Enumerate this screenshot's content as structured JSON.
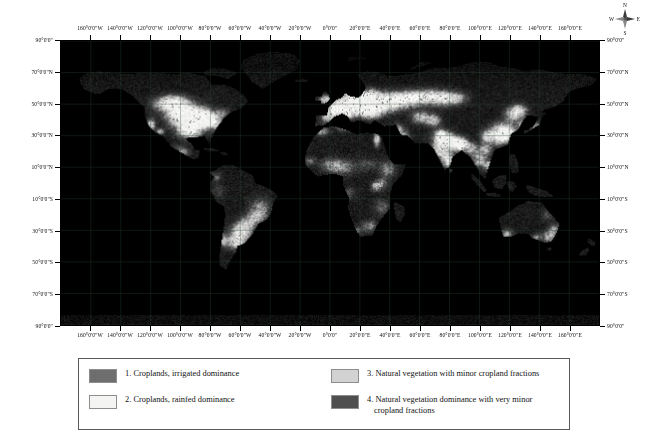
{
  "figure": {
    "type": "world-choropleth-map",
    "projection": "geographic",
    "background_color": "#ffffff"
  },
  "map": {
    "ocean_color": "#000000",
    "frame_color": "#000000",
    "graticule_color": "#2d4a36",
    "land_palette": {
      "class1_irrigated_dominance": "#6e6e6e",
      "class2_rainfed_dominance": "#f2f2f0",
      "class3_minor_cropland": "#b9b9b9",
      "class4_very_minor_cropland": "#4a4a4a"
    }
  },
  "axes": {
    "lon_labels": [
      "160°0'0\"W",
      "140°0'0\"W",
      "120°0'0\"W",
      "100°0'0\"W",
      "80°0'0\"W",
      "60°0'0\"W",
      "40°0'0\"W",
      "20°0'0\"W",
      "0°0'0\"",
      "20°0'0\"E",
      "40°0'0\"E",
      "60°0'0\"E",
      "80°0'0\"E",
      "100°0'0\"E",
      "120°0'0\"E",
      "140°0'0\"E",
      "160°0'0\"E"
    ],
    "lon_values": [
      -160,
      -140,
      -120,
      -100,
      -80,
      -60,
      -40,
      -20,
      0,
      20,
      40,
      60,
      80,
      100,
      120,
      140,
      160
    ],
    "lat_labels": [
      "90°0'0\"",
      "70°0'0\"N",
      "50°0'0\"N",
      "30°0'0\"N",
      "10°0'0\"N",
      "10°0'0\"S",
      "30°0'0\"S",
      "50°0'0\"S",
      "70°0'0\"S",
      "90°0'0\""
    ],
    "lat_values": [
      90,
      70,
      50,
      30,
      10,
      -10,
      -30,
      -50,
      -70,
      -90
    ],
    "lon_range": [
      -180,
      180
    ],
    "lat_range": [
      -90,
      90
    ]
  },
  "compass": {
    "north": "N",
    "east": "E",
    "south": "S",
    "west": "W"
  },
  "legend": {
    "entries": [
      {
        "number": "1.",
        "label": "1. Croplands, irrigated dominance",
        "line1": "1. Croplands, irrigated dominance",
        "line2": "",
        "color": "#6e6e6e"
      },
      {
        "number": "2.",
        "label": "2. Croplands, rainfed dominance",
        "line1": "2. Croplands, rainfed dominance",
        "line2": "",
        "color": "#f4f4f2"
      },
      {
        "number": "3.",
        "label": "3. Natural vegetation with minor cropland fractions",
        "line1": "3. Natural vegetation with minor cropland fractions",
        "line2": "",
        "color": "#d2d2d2"
      },
      {
        "number": "4.",
        "label": "4. Natural vegetation dominance with very minor cropland fractions",
        "line1": "4. Natural vegetation dominance with very minor",
        "line2": "cropland fractions",
        "color": "#4f4f4f"
      }
    ]
  },
  "chart_data": {
    "type": "heatmap",
    "title": "",
    "xlabel": "",
    "ylabel": "",
    "xlim": [
      -180,
      180
    ],
    "ylim": [
      -90,
      90
    ],
    "grid": true,
    "legend_position": "bottom",
    "classes": [
      {
        "value": 1,
        "name": "Croplands, irrigated dominance",
        "color": "#6e6e6e"
      },
      {
        "value": 2,
        "name": "Croplands, rainfed dominance",
        "color": "#f4f4f2"
      },
      {
        "value": 3,
        "name": "Natural vegetation with minor cropland fractions",
        "color": "#d2d2d2"
      },
      {
        "value": 4,
        "name": "Natural vegetation dominance with very minor cropland fractions",
        "color": "#4f4f4f"
      }
    ],
    "regions": [
      {
        "name": "North America",
        "dominant_class": 2,
        "note": "bright rainfed cropland belt across US Midwest and Canadian prairies"
      },
      {
        "name": "Central America",
        "dominant_class": 3,
        "note": "mixed minor cropland fractions"
      },
      {
        "name": "South America",
        "dominant_class": 3,
        "note": "bright rainfed patches in Argentina Pampas and southern Brazil; dark Amazon"
      },
      {
        "name": "Europe",
        "dominant_class": 2,
        "note": "extensive bright rainfed cropland"
      },
      {
        "name": "Africa",
        "dominant_class": 4,
        "note": "Sahel and east African highlands show minor cropland; Sahara and Congo dark"
      },
      {
        "name": "South Asia",
        "dominant_class": 1,
        "note": "Indo-Gangetic plain irrigated dominance"
      },
      {
        "name": "East Asia",
        "dominant_class": 1,
        "note": "North China Plain irrigated dominance"
      },
      {
        "name": "Siberia",
        "dominant_class": 4,
        "note": "natural vegetation dominance, very minor cropland"
      },
      {
        "name": "Australia",
        "dominant_class": 4,
        "note": "interior natural vegetation; southeast and southwest cropland fringes"
      }
    ]
  }
}
